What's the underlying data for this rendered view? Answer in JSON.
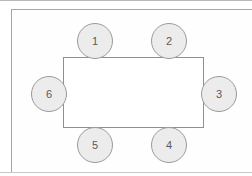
{
  "diagram": {
    "table": {
      "label": "table",
      "shape": "rectangle",
      "fill_color": "#ffffff",
      "stroke_color": "#8f8f8f",
      "x": 63,
      "y": 57,
      "width": 141,
      "height": 71
    },
    "seat_style": {
      "fill_color": "#ececec",
      "stroke_color": "#9a9a9a",
      "text_color": "#5a5a5a",
      "diameter": 36
    },
    "frame": {
      "stroke_color": "#a6a6a6"
    },
    "seats": [
      {
        "label": "1",
        "side": "top",
        "cx": 95,
        "cy": 41
      },
      {
        "label": "2",
        "side": "top",
        "cx": 169,
        "cy": 41
      },
      {
        "label": "3",
        "side": "right",
        "cx": 219,
        "cy": 94
      },
      {
        "label": "4",
        "side": "bottom",
        "cx": 169,
        "cy": 145
      },
      {
        "label": "5",
        "side": "bottom",
        "cx": 95,
        "cy": 145
      },
      {
        "label": "6",
        "side": "left",
        "cx": 49,
        "cy": 94
      }
    ]
  }
}
